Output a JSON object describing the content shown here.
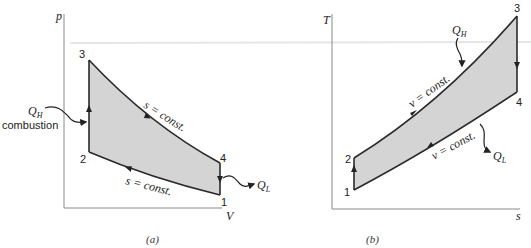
{
  "diagram_a": {
    "caption": "(a)",
    "y_axis_label": "p",
    "x_axis_label": "V",
    "states": [
      "1",
      "2",
      "3",
      "4"
    ],
    "process_labels": {
      "upper": "s = const.",
      "lower": "s = const."
    },
    "heat_in_label": "Q",
    "heat_in_sub": "H",
    "heat_in_note": "combustion",
    "heat_out_label": "Q",
    "heat_out_sub": "L"
  },
  "diagram_b": {
    "caption": "(b)",
    "y_axis_label": "T",
    "x_axis_label": "s",
    "states": [
      "1",
      "2",
      "3",
      "4"
    ],
    "process_labels": {
      "upper": "v = const.",
      "lower": "v = const."
    },
    "heat_in_label": "Q",
    "heat_in_sub": "H",
    "heat_out_label": "Q",
    "heat_out_sub": "L"
  },
  "colors": {
    "fill": "#d4d4d4",
    "line": "#2a2a2a",
    "axis": "#8a8a8a"
  }
}
